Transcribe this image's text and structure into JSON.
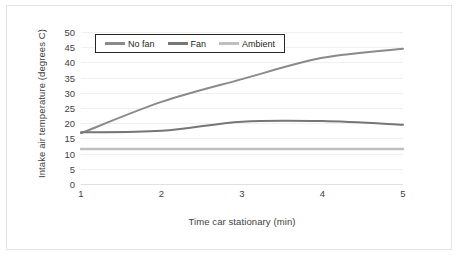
{
  "chart_data": {
    "type": "line",
    "title": "",
    "xlabel": "Time car stationary  (min)",
    "ylabel": "Intake air temperature  (degrees C)",
    "x": [
      1,
      2,
      3,
      4,
      5
    ],
    "xticklabels": [
      "1",
      "2",
      "3",
      "4",
      "5"
    ],
    "yticklabels": [
      "50",
      "45",
      "40",
      "35",
      "30",
      "25",
      "20",
      "15",
      "10",
      "5",
      "0"
    ],
    "yticks": [
      50,
      45,
      40,
      35,
      30,
      25,
      20,
      15,
      10,
      5,
      0
    ],
    "xlim": [
      1,
      5
    ],
    "ylim": [
      0,
      50
    ],
    "grid": true,
    "grid_axis": "y",
    "legend_position": "top-left-inside",
    "series": [
      {
        "name": "No fan",
        "color": "#8a8a8a",
        "width": 2.0,
        "values": [
          16.7,
          27.0,
          34.5,
          41.5,
          44.5
        ]
      },
      {
        "name": "Fan",
        "color": "#767676",
        "width": 2.0,
        "values": [
          17.0,
          17.5,
          20.5,
          20.7,
          19.5
        ]
      },
      {
        "name": "Ambient",
        "color": "#bfbfbf",
        "width": 2.4,
        "values": [
          11.5,
          11.5,
          11.5,
          11.5,
          11.5
        ]
      }
    ]
  },
  "colors": {
    "frame_border": "#e3e3e3",
    "gridline": "#f0f0f0",
    "text": "#3f3f3f",
    "legend_border": "#262626",
    "background": "#ffffff"
  }
}
